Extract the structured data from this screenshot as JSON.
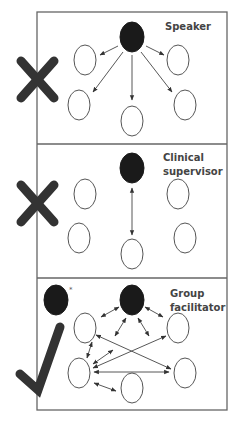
{
  "figure": {
    "panels": [
      {
        "id": "speaker",
        "label_lines": [
          "Speaker"
        ],
        "verdict": "incorrect",
        "verdict_icon": "cross-icon",
        "communication": "one-way from leader to each member"
      },
      {
        "id": "clinical-supervisor",
        "label_lines": [
          "Clinical",
          "supervisor"
        ],
        "verdict": "incorrect",
        "verdict_icon": "cross-icon",
        "communication": "two-way between leader and a single member"
      },
      {
        "id": "group-facilitator",
        "label_lines": [
          "Group",
          "facilitator"
        ],
        "verdict": "correct",
        "verdict_icon": "check-icon",
        "communication": "two-way among leader and all members",
        "extra_marker": "*"
      }
    ],
    "colors": {
      "leader_fill": "#1a1a1a",
      "member_stroke": "#555555",
      "border": "#666666",
      "mark": "#333333"
    }
  }
}
